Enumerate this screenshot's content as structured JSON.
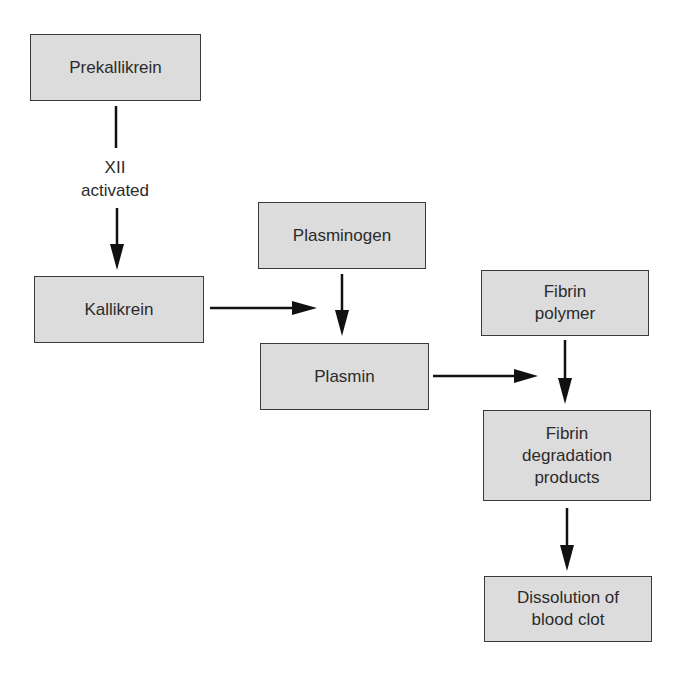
{
  "diagram": {
    "type": "flowchart",
    "title": "",
    "nodes": [
      {
        "id": "prekallikrein",
        "label": "Prekallikrein"
      },
      {
        "id": "kallikrein",
        "label": "Kallikrein"
      },
      {
        "id": "plasminogen",
        "label": "Plasminogen"
      },
      {
        "id": "plasmin",
        "label": "Plasmin"
      },
      {
        "id": "fibrin_polymer",
        "label": "Fibrin\npolymer"
      },
      {
        "id": "fibrin_degradation",
        "label": "Fibrin\ndegradation\nproducts"
      },
      {
        "id": "dissolution",
        "label": "Dissolution of\nblood clot"
      }
    ],
    "edges": [
      {
        "from": "prekallikrein",
        "to": "kallikrein",
        "label": "XII\nactivated"
      },
      {
        "from": "kallikrein",
        "to": "plasminogen_to_plasmin",
        "label": ""
      },
      {
        "from": "plasminogen",
        "to": "plasmin",
        "label": ""
      },
      {
        "from": "plasmin",
        "to": "fibrin_polymer_to_degradation",
        "label": ""
      },
      {
        "from": "fibrin_polymer",
        "to": "fibrin_degradation",
        "label": ""
      },
      {
        "from": "fibrin_degradation",
        "to": "dissolution",
        "label": ""
      }
    ],
    "edge_label_xii": "XII\nactivated"
  },
  "colors": {
    "box_fill": "#dcdcdc",
    "box_border": "#3a3a3a",
    "arrow": "#111111",
    "text": "#2b2b2b",
    "background": "#ffffff"
  }
}
